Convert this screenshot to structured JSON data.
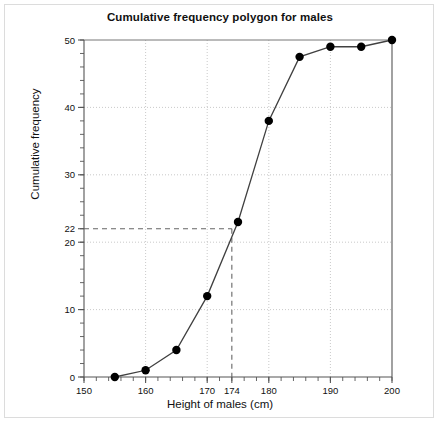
{
  "chart_data": {
    "type": "line",
    "title": "Cumulative frequency polygon for males",
    "xlabel": "Height of males (cm)",
    "ylabel": "Cumulative frequency",
    "xlim": [
      150,
      200
    ],
    "ylim": [
      0,
      50
    ],
    "grid": true,
    "legend": "none",
    "x": [
      155,
      160,
      165,
      170,
      175,
      180,
      185,
      190,
      195,
      200
    ],
    "values": [
      0,
      1,
      4,
      12,
      23,
      38,
      47.5,
      49,
      49,
      50
    ],
    "series": [
      {
        "name": "Cumulative frequency for males",
        "x": [
          155,
          160,
          165,
          170,
          175,
          180,
          185,
          190,
          195,
          200
        ],
        "values": [
          0,
          1,
          4,
          12,
          23,
          38,
          47.5,
          49,
          49,
          50
        ]
      }
    ],
    "x_major_ticks": [
      150,
      160,
      170,
      174,
      180,
      190,
      200
    ],
    "x_tick_labels": [
      "150",
      "160",
      "170",
      "174",
      "180",
      "190",
      "200"
    ],
    "x_minor_tick_step": 2,
    "y_major_ticks": [
      0,
      10,
      20,
      22,
      30,
      40,
      50
    ],
    "y_tick_labels": [
      "0",
      "10",
      "20",
      "22",
      "30",
      "40",
      "50"
    ],
    "y_minor_tick_step": 2,
    "gridlines_x": [
      160,
      170,
      180,
      190
    ],
    "gridlines_y": [
      10,
      20,
      30,
      40
    ],
    "annotations": [
      {
        "name": "median-guide-horizontal",
        "style": "dashed",
        "from": [
          150,
          22
        ],
        "to": [
          174,
          22
        ],
        "value": 22
      },
      {
        "name": "median-guide-vertical",
        "style": "dashed",
        "from": [
          174,
          22
        ],
        "to": [
          174,
          0
        ],
        "value": 174
      }
    ],
    "colors": {
      "line": "#404040",
      "marker": "#000000",
      "grid": "#bbbbbb",
      "axis": "#555555",
      "guide": "#666666",
      "background": "#ffffff"
    }
  }
}
